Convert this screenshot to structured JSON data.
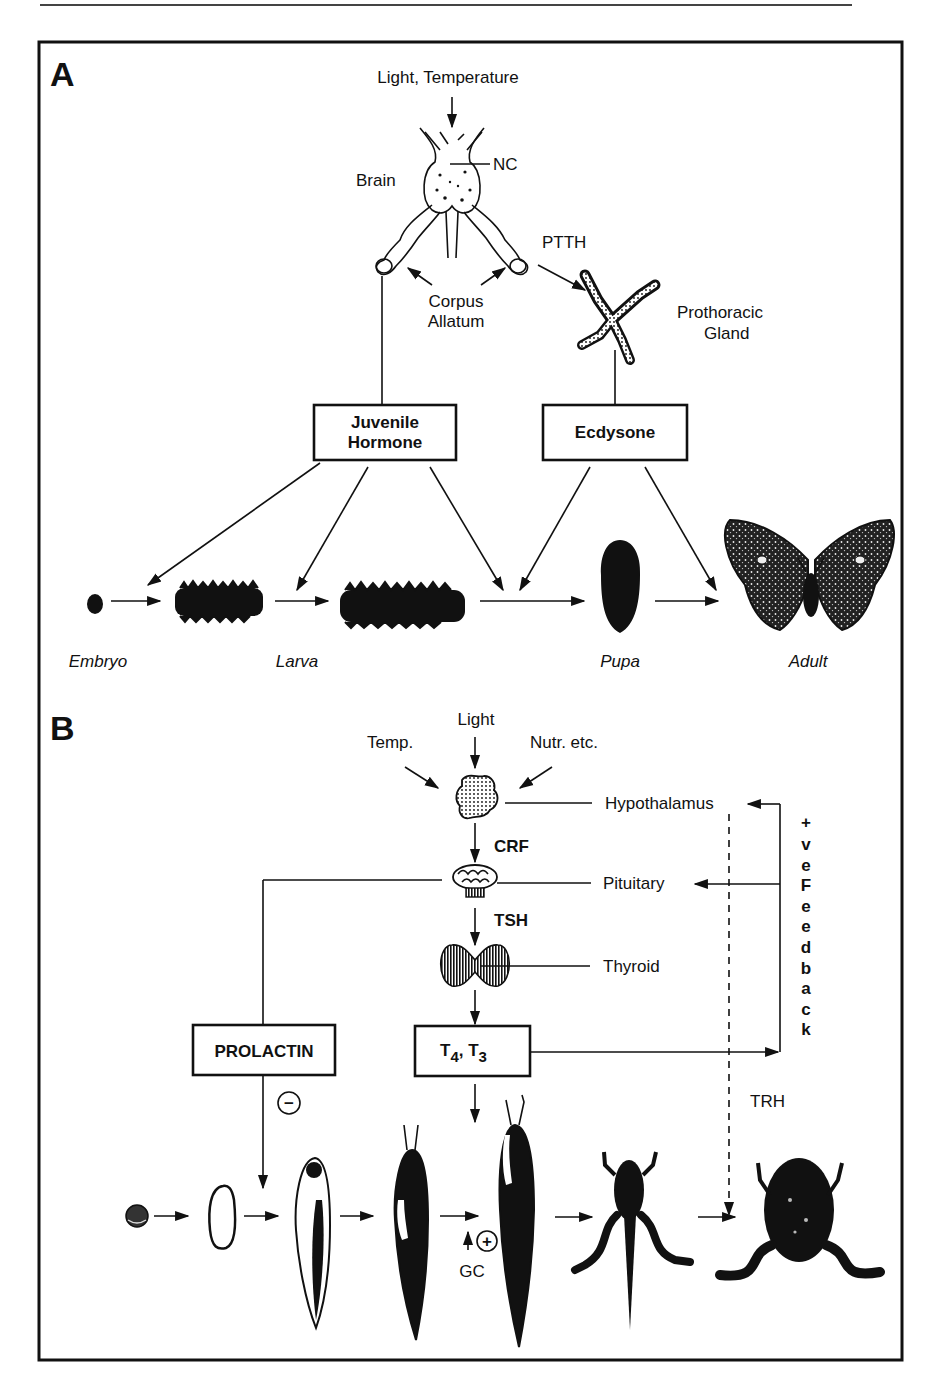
{
  "header": {
    "running_head": "Developmental processes regulated by hormones in insects and amphibians"
  },
  "panel_a": {
    "label": "A",
    "inputs": "Light, Temperature",
    "brain": "Brain",
    "nc": "NC",
    "ptth": "PTTH",
    "corpus_allatum_line1": "Corpus",
    "corpus_allatum_line2": "Allatum",
    "prothoracic_line1": "Prothoracic",
    "prothoracic_line2": "Gland",
    "jh_line1": "Juvenile",
    "jh_line2": "Hormone",
    "ecdysone": "Ecdysone",
    "stages": [
      "Embryo",
      "Larva",
      "Pupa",
      "Adult"
    ]
  },
  "panel_b": {
    "label": "B",
    "light": "Light",
    "temp": "Temp.",
    "nutr": "Nutr. etc.",
    "hypothalamus": "Hypothalamus",
    "crf": "CRF",
    "pituitary": "Pituitary",
    "tsh": "TSH",
    "thyroid": "Thyroid",
    "prolactin": "PROLACTIN",
    "t4": "T",
    "t4_sub": "4",
    "t3": ", T",
    "t3_sub": "3",
    "minus": "−",
    "plus": "+",
    "gc": "GC",
    "trh": "TRH",
    "feedback_letters": [
      "+",
      "v",
      "e",
      "F",
      "e",
      "e",
      "d",
      "b",
      "a",
      "c",
      "k"
    ]
  }
}
